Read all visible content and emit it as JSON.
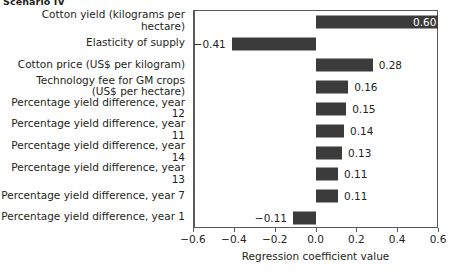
{
  "chart_data": {
    "type": "bar",
    "orientation": "horizontal",
    "title": "Scenario IV",
    "xlabel": "Regression coefficient value",
    "ylabel": "",
    "xlim": [
      -0.6,
      0.6
    ],
    "xticks": [
      "−0.6",
      "−0.4",
      "−0.2",
      "0.0",
      "0.2",
      "0.4",
      "0.6"
    ],
    "xtick_values": [
      -0.6,
      -0.4,
      -0.2,
      0.0,
      0.2,
      0.4,
      0.6
    ],
    "grid": false,
    "legend": null,
    "bar_color": "#3b3b3b",
    "categories": [
      "Cotton yield (kilograms per hectare)",
      "Elasticity of supply",
      "Cotton price (US$ per kilogram)",
      "Technology fee for GM crops|(US$ per hectare)",
      "Percentage yield difference, year 12",
      "Percentage yield difference, year 11",
      "Percentage yield difference, year 14",
      "Percentage yield difference, year 13",
      "Percentage yield difference, year 7",
      "Percentage yield difference, year 1"
    ],
    "values": [
      0.6,
      -0.41,
      0.28,
      0.16,
      0.15,
      0.14,
      0.13,
      0.11,
      0.11,
      -0.11
    ],
    "labels": [
      "0.60",
      "−0.41",
      "0.28",
      "0.16",
      "0.15",
      "0.14",
      "0.13",
      "0.11",
      "0.11",
      "−0.11"
    ]
  }
}
